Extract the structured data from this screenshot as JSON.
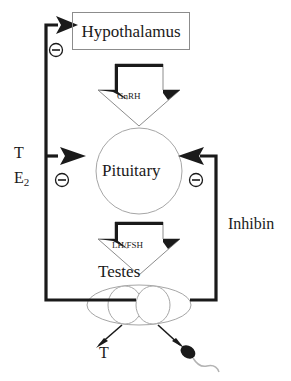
{
  "diagram": {
    "colors": {
      "line_dark": "#1a1a1a",
      "outline_gray": "#8c8c8c",
      "outline_light": "#a6a6a6",
      "background": "#ffffff",
      "text": "#1a1a1a"
    },
    "nodes": {
      "hypothalamus": {
        "label": "Hypothalamus",
        "shape": "rectangle"
      },
      "pituitary": {
        "label": "Pituitary",
        "shape": "circle"
      },
      "testes": {
        "label": "Testes",
        "shape": "ellipse"
      }
    },
    "hormone_arrows": [
      {
        "label": "GnRH",
        "from": "hypothalamus",
        "to": "pituitary",
        "direction": "down"
      },
      {
        "label": "LH/FSH",
        "from": "pituitary",
        "to": "testes",
        "direction": "down"
      }
    ],
    "feedback": {
      "inhibin": {
        "label": "Inhibin",
        "from": "testes",
        "to": "pituitary",
        "sign": "negative"
      },
      "steroid_to_hypothalamus": {
        "sign": "negative"
      },
      "steroid_to_pituitary": {
        "sign": "negative"
      }
    },
    "signs": [
      {
        "name": "minus-hypothalamus",
        "symbol": "−"
      },
      {
        "name": "minus-pituitary-left",
        "symbol": "−"
      },
      {
        "name": "minus-pituitary-right",
        "symbol": "−"
      }
    ],
    "left_inputs": {
      "testosterone": "T",
      "estradiol_base": "E",
      "estradiol_sub": "2"
    },
    "outputs": {
      "testosterone": "T",
      "sperm": "sperm-cell"
    }
  }
}
